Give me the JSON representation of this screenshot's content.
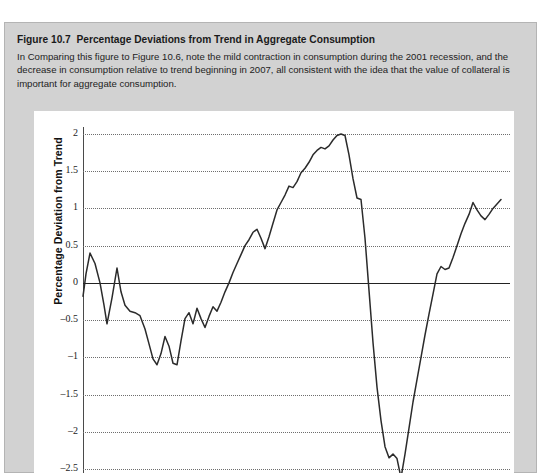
{
  "figure": {
    "number": "Figure 10.7",
    "title": "Percentage Deviations from Trend in Aggregate Consumption",
    "description": "In Comparing this figure to Figure 10.6, note the mild contraction in consumption during the 2001 recession, and the decrease in consumption relative to trend beginning in 2007, all consistent with the idea that the value of collateral is important for aggregate consumption."
  },
  "colors": {
    "page_background": "#ffffff",
    "figure_background": "#d2d2d2",
    "figure_border": "#b4b4b4",
    "plot_background": "#ffffff",
    "series_line": "#2b2b2b",
    "zero_line": "#222222",
    "gridline": "#6e6e6e",
    "axis_line": "#4a4a4a",
    "text": "#1a1a1a"
  },
  "chart_data": {
    "type": "line",
    "title": "Percentage Deviations from Trend in Aggregate Consumption",
    "xlabel": "",
    "ylabel": "Percentage Deviation from Trend",
    "ylim": [
      -2.75,
      2.2
    ],
    "yticks": [
      2,
      1.5,
      1,
      0.5,
      0,
      -0.5,
      -1,
      -1.5,
      -2,
      -2.5
    ],
    "ytick_labels": [
      "2",
      "1.5",
      "1",
      "0.5",
      "0",
      "–0.5",
      "–1",
      "–1.5",
      "–2",
      "–2.5"
    ],
    "grid": true,
    "grid_style": "dotted-horizontal",
    "zero_line": 0,
    "legend": null,
    "xticks": [],
    "xtick_labels": [],
    "note": "Horizontal axis labels are cropped below the visible image area.",
    "series": [
      {
        "name": "Percentage deviation from trend in aggregate consumption",
        "x": [
          0,
          3,
          7,
          12,
          17,
          21,
          24,
          29,
          34,
          38,
          42,
          47,
          52,
          57,
          62,
          66,
          70,
          74,
          78,
          82,
          86,
          90,
          94,
          98,
          102,
          106,
          110,
          114,
          118,
          122,
          126,
          130,
          134,
          138,
          142,
          146,
          150,
          154,
          158,
          162,
          166,
          170,
          174,
          178,
          182,
          186,
          190,
          194,
          198,
          202,
          206,
          210,
          214,
          218,
          222,
          226,
          230,
          234,
          238,
          242,
          246,
          250,
          254,
          258,
          262,
          266,
          270,
          274,
          278,
          282,
          286,
          290,
          294,
          298,
          302,
          306,
          310,
          314,
          318,
          322,
          326,
          330,
          334,
          338,
          342,
          346,
          350,
          354,
          358,
          362,
          366,
          370,
          374,
          378,
          382,
          386,
          390,
          394,
          398,
          402,
          406,
          410,
          414,
          418
        ],
        "y": [
          -0.18,
          0.12,
          0.4,
          0.26,
          0.0,
          -0.3,
          -0.55,
          -0.2,
          0.2,
          -0.12,
          -0.3,
          -0.38,
          -0.4,
          -0.44,
          -0.62,
          -0.82,
          -1.02,
          -1.1,
          -0.95,
          -0.72,
          -0.85,
          -1.08,
          -1.1,
          -0.78,
          -0.48,
          -0.4,
          -0.55,
          -0.34,
          -0.48,
          -0.6,
          -0.45,
          -0.32,
          -0.38,
          -0.26,
          -0.12,
          0.0,
          0.14,
          0.26,
          0.38,
          0.5,
          0.58,
          0.68,
          0.72,
          0.6,
          0.46,
          0.62,
          0.8,
          0.98,
          1.08,
          1.18,
          1.3,
          1.28,
          1.36,
          1.48,
          1.54,
          1.62,
          1.72,
          1.78,
          1.82,
          1.8,
          1.84,
          1.92,
          1.98,
          2.0,
          1.98,
          1.72,
          1.4,
          1.14,
          1.12,
          0.6,
          -0.1,
          -0.8,
          -1.4,
          -1.85,
          -2.2,
          -2.35,
          -2.3,
          -2.36,
          -2.62,
          -2.3,
          -1.95,
          -1.6,
          -1.3,
          -1.0,
          -0.7,
          -0.42,
          -0.15,
          0.12,
          0.22,
          0.18,
          0.2,
          0.34,
          0.5,
          0.66,
          0.8,
          0.92,
          1.08,
          0.98,
          0.9,
          0.85,
          0.92,
          1.0,
          1.06,
          1.12
        ]
      }
    ]
  }
}
